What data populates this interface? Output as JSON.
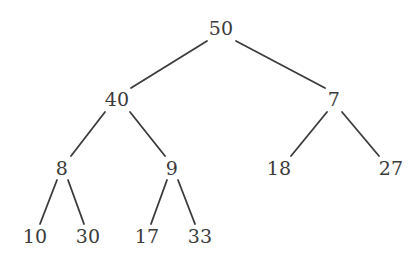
{
  "figure": {
    "kind": "binary-tree-diagram",
    "width": 419,
    "height": 260,
    "background_color": "#ffffff",
    "edge_color": "#3b3b3b",
    "text_color": "#3b3b3b",
    "edge_width": 1.8
  },
  "tree": {
    "nodes": [
      {
        "id": "n50",
        "label": "50",
        "x": 221,
        "y": 28,
        "level": 0
      },
      {
        "id": "n40",
        "label": "40",
        "x": 117,
        "y": 99,
        "level": 1
      },
      {
        "id": "n7",
        "label": "7",
        "x": 334,
        "y": 99,
        "level": 1
      },
      {
        "id": "n8",
        "label": "8",
        "x": 62,
        "y": 168,
        "level": 2
      },
      {
        "id": "n9",
        "label": "9",
        "x": 172,
        "y": 168,
        "level": 2
      },
      {
        "id": "n18",
        "label": "18",
        "x": 279,
        "y": 168,
        "level": 2
      },
      {
        "id": "n27",
        "label": "27",
        "x": 391,
        "y": 168,
        "level": 2
      },
      {
        "id": "n10",
        "label": "10",
        "x": 35,
        "y": 236,
        "level": 3
      },
      {
        "id": "n30",
        "label": "30",
        "x": 88,
        "y": 236,
        "level": 3
      },
      {
        "id": "n17",
        "label": "17",
        "x": 147,
        "y": 236,
        "level": 3
      },
      {
        "id": "n33",
        "label": "33",
        "x": 200,
        "y": 236,
        "level": 3
      }
    ],
    "edges": [
      {
        "id": "e50-40",
        "from": "n50",
        "to": "n40",
        "x1": 207,
        "y1": 41,
        "x2": 131,
        "y2": 88
      },
      {
        "id": "e50-7",
        "from": "n50",
        "to": "n7",
        "x1": 236,
        "y1": 41,
        "x2": 325,
        "y2": 88
      },
      {
        "id": "e40-8",
        "from": "n40",
        "to": "n8",
        "x1": 105,
        "y1": 112,
        "x2": 71,
        "y2": 156
      },
      {
        "id": "e40-9",
        "from": "n40",
        "to": "n9",
        "x1": 130,
        "y1": 112,
        "x2": 165,
        "y2": 156
      },
      {
        "id": "e7-18",
        "from": "n7",
        "to": "n18",
        "x1": 327,
        "y1": 112,
        "x2": 291,
        "y2": 156
      },
      {
        "id": "e7-27",
        "from": "n7",
        "to": "n27",
        "x1": 342,
        "y1": 112,
        "x2": 379,
        "y2": 156
      },
      {
        "id": "e8-10",
        "from": "n8",
        "to": "n10",
        "x1": 57,
        "y1": 180,
        "x2": 40,
        "y2": 224
      },
      {
        "id": "e8-30",
        "from": "n8",
        "to": "n30",
        "x1": 68,
        "y1": 180,
        "x2": 84,
        "y2": 224
      },
      {
        "id": "e9-17",
        "from": "n9",
        "to": "n17",
        "x1": 167,
        "y1": 180,
        "x2": 151,
        "y2": 224
      },
      {
        "id": "e9-33",
        "from": "n9",
        "to": "n33",
        "x1": 178,
        "y1": 180,
        "x2": 195,
        "y2": 224
      }
    ]
  }
}
